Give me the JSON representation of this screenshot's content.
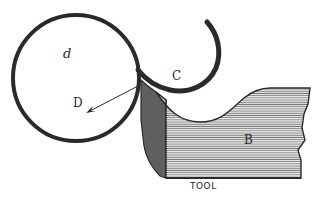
{
  "figure": {
    "labels": {
      "workpiece": "d",
      "centre": "D",
      "shaving": "C",
      "tool_body": "B",
      "caption": "TOOL"
    },
    "colors": {
      "ink": "#2a2a2a",
      "hatch": "#6e6e6e",
      "paper": "#ffffff"
    }
  }
}
